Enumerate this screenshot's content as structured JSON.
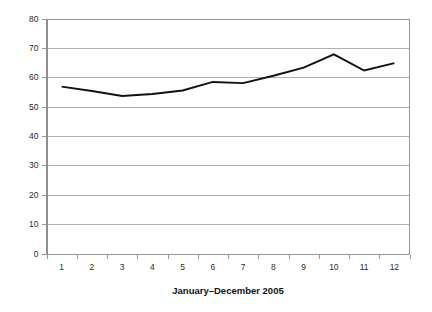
{
  "chart_data": {
    "type": "line",
    "title": "",
    "subtitle": "",
    "xlabel": "January–December 2005",
    "ylabel": "",
    "categories": [
      "1",
      "2",
      "3",
      "4",
      "5",
      "6",
      "7",
      "8",
      "9",
      "10",
      "11",
      "12"
    ],
    "series": [
      {
        "name": "series-1",
        "color": "#111111",
        "values": [
          56.8,
          55.3,
          53.6,
          54.3,
          55.5,
          58.4,
          58.0,
          60.5,
          63.3,
          67.8,
          62.3,
          64.8
        ]
      }
    ],
    "ylim": [
      0,
      80
    ],
    "yticks": [
      0,
      10,
      20,
      30,
      40,
      50,
      60,
      70,
      80
    ],
    "ytick_labels": [
      "0",
      "10",
      "20",
      "30",
      "40",
      "50",
      "60",
      "70",
      "80"
    ],
    "xtick_labels": [
      "1",
      "2",
      "3",
      "4",
      "5",
      "6",
      "7",
      "8",
      "9",
      "10",
      "11",
      "12"
    ],
    "grid": {
      "horizontal": true,
      "vertical": false,
      "color": "#9a9a9a"
    },
    "legend": {
      "visible": false,
      "position": "none",
      "entries": []
    },
    "annotations": [],
    "axis_colors": {
      "axis": "#8e8e8e",
      "text": "#2b2b2b",
      "title": "#111111"
    },
    "frame": {
      "top": true,
      "right": true,
      "bottom": true,
      "left": true
    },
    "markers": false,
    "background": "#ffffff"
  }
}
